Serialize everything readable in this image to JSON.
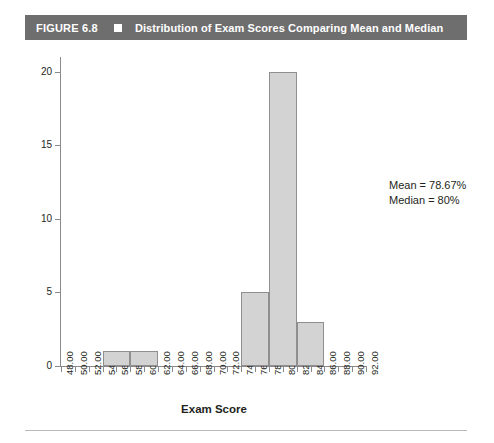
{
  "caption": {
    "figure_label": "FIGURE 6.8",
    "marker_icon": "filled-square-icon",
    "title": "Distribution of Exam Scores Comparing Mean and Median",
    "bar_color": "#6e6e6e",
    "text_color": "#ffffff"
  },
  "annotation": {
    "mean_line": "Mean = 78.67%",
    "median_line": "Median = 80%"
  },
  "chart_data": {
    "type": "bar",
    "title": "Distribution of Exam Scores Comparing Mean and Median",
    "xlabel": "Exam Score",
    "ylabel": "Frequency",
    "grid": false,
    "legend": "none",
    "bar_fill": "#d3d3d3",
    "bar_stroke": "#8f8f8f",
    "xlim": [
      48,
      92
    ],
    "ylim": [
      0,
      21
    ],
    "x_tick_labels": [
      "48.00",
      "50.00",
      "52.00",
      "54.00",
      "56.00",
      "58.00",
      "60.00",
      "62.00",
      "64.00",
      "66.00",
      "68.00",
      "70.00",
      "72.00",
      "74.00",
      "76.00",
      "78.00",
      "80.00",
      "82.00",
      "84.00",
      "86.00",
      "88.00",
      "90.00",
      "92.00"
    ],
    "x_tick_values": [
      48,
      50,
      52,
      54,
      56,
      58,
      60,
      62,
      64,
      66,
      68,
      70,
      72,
      74,
      76,
      78,
      80,
      82,
      84,
      86,
      88,
      90,
      92
    ],
    "y_tick_labels": [
      "0",
      "5",
      "10",
      "15",
      "20"
    ],
    "y_tick_values": [
      0,
      5,
      10,
      15,
      20
    ],
    "bin_width": 4,
    "bins": [
      {
        "start": 54,
        "end": 58,
        "frequency": 1
      },
      {
        "start": 58,
        "end": 62,
        "frequency": 1
      },
      {
        "start": 74,
        "end": 78,
        "frequency": 5
      },
      {
        "start": 78,
        "end": 82,
        "frequency": 20
      },
      {
        "start": 82,
        "end": 86,
        "frequency": 3
      }
    ],
    "categories": [
      "54-58",
      "58-62",
      "74-78",
      "78-82",
      "82-86"
    ],
    "values": [
      1,
      1,
      5,
      20,
      3
    ],
    "annotations": [
      "Mean = 78.67%",
      "Median = 80%"
    ]
  }
}
